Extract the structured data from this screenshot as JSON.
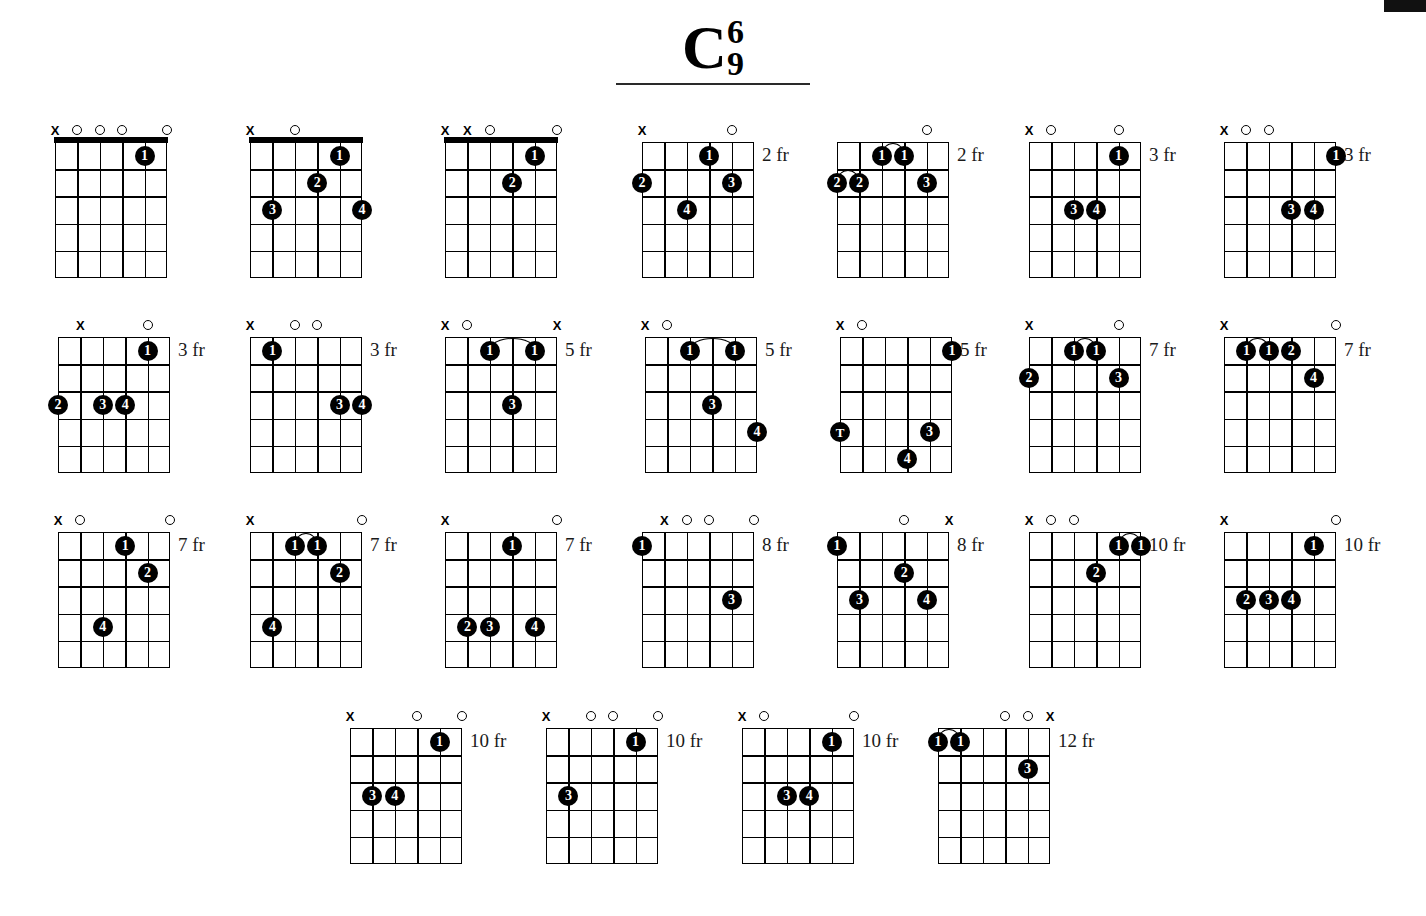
{
  "title": {
    "root": "C",
    "upper": "6",
    "lower": "9"
  },
  "meta": {
    "instrument": "guitar",
    "strings": 6,
    "frets": 5,
    "marker_open": "O",
    "marker_muted": "X"
  },
  "chords": [
    {
      "id": "chord-1",
      "x": 55,
      "y": 124,
      "fret_label": "",
      "nut": true,
      "markers": [
        "x",
        "o",
        "o",
        "o",
        "",
        "o"
      ],
      "dots": [
        {
          "string": 5,
          "fret": 1,
          "finger": "1"
        }
      ],
      "barres": []
    },
    {
      "id": "chord-2",
      "x": 250,
      "y": 124,
      "fret_label": "",
      "nut": true,
      "markers": [
        "x",
        "",
        "o",
        "",
        "",
        ""
      ],
      "dots": [
        {
          "string": 5,
          "fret": 1,
          "finger": "1"
        },
        {
          "string": 4,
          "fret": 2,
          "finger": "2"
        },
        {
          "string": 2,
          "fret": 3,
          "finger": "3"
        },
        {
          "string": 6,
          "fret": 3,
          "finger": "4"
        }
      ],
      "barres": []
    },
    {
      "id": "chord-3",
      "x": 445,
      "y": 124,
      "fret_label": "",
      "nut": true,
      "markers": [
        "x",
        "x",
        "o",
        "",
        "",
        "o"
      ],
      "dots": [
        {
          "string": 5,
          "fret": 1,
          "finger": "1"
        },
        {
          "string": 4,
          "fret": 2,
          "finger": "2"
        }
      ],
      "barres": []
    },
    {
      "id": "chord-4",
      "x": 642,
      "y": 124,
      "fret_label": "2 fr",
      "nut": false,
      "markers": [
        "x",
        "",
        "",
        "",
        "o",
        ""
      ],
      "dots": [
        {
          "string": 4,
          "fret": 1,
          "finger": "1"
        },
        {
          "string": 1,
          "fret": 2,
          "finger": "2"
        },
        {
          "string": 5,
          "fret": 2,
          "finger": "3"
        },
        {
          "string": 3,
          "fret": 3,
          "finger": "4"
        }
      ],
      "barres": []
    },
    {
      "id": "chord-5",
      "x": 837,
      "y": 124,
      "fret_label": "2 fr",
      "nut": false,
      "markers": [
        "",
        "",
        "",
        "",
        "o",
        ""
      ],
      "dots": [
        {
          "string": 3,
          "fret": 1,
          "finger": "1"
        },
        {
          "string": 4,
          "fret": 1,
          "finger": "1"
        },
        {
          "string": 1,
          "fret": 2,
          "finger": "2"
        },
        {
          "string": 2,
          "fret": 2,
          "finger": "2"
        },
        {
          "string": 5,
          "fret": 2,
          "finger": "3"
        }
      ],
      "barres": [
        {
          "fret": 1,
          "from": 3,
          "to": 4
        },
        {
          "fret": 2,
          "from": 1,
          "to": 2
        }
      ]
    },
    {
      "id": "chord-6",
      "x": 1029,
      "y": 124,
      "fret_label": "3 fr",
      "nut": false,
      "markers": [
        "x",
        "o",
        "",
        "",
        "o",
        ""
      ],
      "dots": [
        {
          "string": 5,
          "fret": 1,
          "finger": "1"
        },
        {
          "string": 3,
          "fret": 3,
          "finger": "3"
        },
        {
          "string": 4,
          "fret": 3,
          "finger": "4"
        }
      ],
      "barres": []
    },
    {
      "id": "chord-7",
      "x": 1224,
      "y": 124,
      "fret_label": "3 fr",
      "nut": false,
      "markers": [
        "x",
        "o",
        "o",
        "",
        "",
        ""
      ],
      "dots": [
        {
          "string": 6,
          "fret": 1,
          "finger": "1"
        },
        {
          "string": 4,
          "fret": 3,
          "finger": "3"
        },
        {
          "string": 5,
          "fret": 3,
          "finger": "4"
        }
      ],
      "barres": []
    },
    {
      "id": "chord-8",
      "x": 58,
      "y": 319,
      "fret_label": "3 fr",
      "nut": false,
      "markers": [
        "",
        "x",
        "",
        "",
        "o",
        ""
      ],
      "dots": [
        {
          "string": 5,
          "fret": 1,
          "finger": "1"
        },
        {
          "string": 1,
          "fret": 3,
          "finger": "2"
        },
        {
          "string": 3,
          "fret": 3,
          "finger": "3"
        },
        {
          "string": 4,
          "fret": 3,
          "finger": "4"
        }
      ],
      "barres": []
    },
    {
      "id": "chord-9",
      "x": 250,
      "y": 319,
      "fret_label": "3 fr",
      "nut": false,
      "markers": [
        "x",
        "",
        "o",
        "o",
        "",
        ""
      ],
      "dots": [
        {
          "string": 2,
          "fret": 1,
          "finger": "1"
        },
        {
          "string": 5,
          "fret": 3,
          "finger": "3"
        },
        {
          "string": 6,
          "fret": 3,
          "finger": "4"
        }
      ],
      "barres": []
    },
    {
      "id": "chord-10",
      "x": 445,
      "y": 319,
      "fret_label": "5 fr",
      "nut": false,
      "markers": [
        "x",
        "o",
        "",
        "",
        "",
        "x"
      ],
      "dots": [
        {
          "string": 3,
          "fret": 1,
          "finger": "1"
        },
        {
          "string": 5,
          "fret": 1,
          "finger": "1"
        },
        {
          "string": 4,
          "fret": 3,
          "finger": "3"
        }
      ],
      "barres": [
        {
          "fret": 1,
          "from": 3,
          "to": 5
        }
      ]
    },
    {
      "id": "chord-11",
      "x": 645,
      "y": 319,
      "fret_label": "5 fr",
      "nut": false,
      "markers": [
        "x",
        "o",
        "",
        "",
        "",
        ""
      ],
      "dots": [
        {
          "string": 3,
          "fret": 1,
          "finger": "1"
        },
        {
          "string": 5,
          "fret": 1,
          "finger": "1"
        },
        {
          "string": 4,
          "fret": 3,
          "finger": "3"
        },
        {
          "string": 6,
          "fret": 4,
          "finger": "4"
        }
      ],
      "barres": [
        {
          "fret": 1,
          "from": 3,
          "to": 5
        }
      ]
    },
    {
      "id": "chord-12",
      "x": 840,
      "y": 319,
      "fret_label": "5 fr",
      "nut": false,
      "markers": [
        "x",
        "o",
        "",
        "",
        "",
        ""
      ],
      "dots": [
        {
          "string": 6,
          "fret": 1,
          "finger": "1"
        },
        {
          "string": 1,
          "fret": 4,
          "finger": "T"
        },
        {
          "string": 5,
          "fret": 4,
          "finger": "3"
        },
        {
          "string": 4,
          "fret": 5,
          "finger": "4"
        }
      ],
      "barres": []
    },
    {
      "id": "chord-13",
      "x": 1029,
      "y": 319,
      "fret_label": "7 fr",
      "nut": false,
      "markers": [
        "x",
        "",
        "",
        "",
        "o",
        ""
      ],
      "dots": [
        {
          "string": 3,
          "fret": 1,
          "finger": "1"
        },
        {
          "string": 4,
          "fret": 1,
          "finger": "1"
        },
        {
          "string": 1,
          "fret": 2,
          "finger": "2"
        },
        {
          "string": 5,
          "fret": 2,
          "finger": "3"
        }
      ],
      "barres": [
        {
          "fret": 1,
          "from": 3,
          "to": 4
        }
      ]
    },
    {
      "id": "chord-14",
      "x": 1224,
      "y": 319,
      "fret_label": "7 fr",
      "nut": false,
      "markers": [
        "x",
        "",
        "",
        "",
        "",
        "o"
      ],
      "dots": [
        {
          "string": 2,
          "fret": 1,
          "finger": "1"
        },
        {
          "string": 3,
          "fret": 1,
          "finger": "1"
        },
        {
          "string": 4,
          "fret": 1,
          "finger": "2"
        },
        {
          "string": 5,
          "fret": 2,
          "finger": "4"
        }
      ],
      "barres": [
        {
          "fret": 1,
          "from": 2,
          "to": 3
        }
      ]
    },
    {
      "id": "chord-15",
      "x": 58,
      "y": 514,
      "fret_label": "7 fr",
      "nut": false,
      "markers": [
        "x",
        "o",
        "",
        "",
        "",
        "o"
      ],
      "dots": [
        {
          "string": 4,
          "fret": 1,
          "finger": "1"
        },
        {
          "string": 5,
          "fret": 2,
          "finger": "2"
        },
        {
          "string": 3,
          "fret": 4,
          "finger": "4"
        }
      ],
      "barres": []
    },
    {
      "id": "chord-16",
      "x": 250,
      "y": 514,
      "fret_label": "7 fr",
      "nut": false,
      "markers": [
        "x",
        "",
        "",
        "",
        "",
        "o"
      ],
      "dots": [
        {
          "string": 3,
          "fret": 1,
          "finger": "1"
        },
        {
          "string": 4,
          "fret": 1,
          "finger": "1"
        },
        {
          "string": 5,
          "fret": 2,
          "finger": "2"
        },
        {
          "string": 2,
          "fret": 4,
          "finger": "4"
        }
      ],
      "barres": [
        {
          "fret": 1,
          "from": 3,
          "to": 4
        }
      ]
    },
    {
      "id": "chord-17",
      "x": 445,
      "y": 514,
      "fret_label": "7 fr",
      "nut": false,
      "markers": [
        "x",
        "",
        "",
        "",
        "",
        "o"
      ],
      "dots": [
        {
          "string": 4,
          "fret": 1,
          "finger": "1"
        },
        {
          "string": 2,
          "fret": 4,
          "finger": "2"
        },
        {
          "string": 3,
          "fret": 4,
          "finger": "3"
        },
        {
          "string": 5,
          "fret": 4,
          "finger": "4"
        }
      ],
      "barres": []
    },
    {
      "id": "chord-18",
      "x": 642,
      "y": 514,
      "fret_label": "8 fr",
      "nut": false,
      "markers": [
        "",
        "x",
        "o",
        "o",
        "",
        "o"
      ],
      "dots": [
        {
          "string": 1,
          "fret": 1,
          "finger": "1"
        },
        {
          "string": 5,
          "fret": 3,
          "finger": "3"
        }
      ],
      "barres": []
    },
    {
      "id": "chord-19",
      "x": 837,
      "y": 514,
      "fret_label": "8 fr",
      "nut": false,
      "markers": [
        "",
        "",
        "",
        "o",
        "",
        "x"
      ],
      "dots": [
        {
          "string": 1,
          "fret": 1,
          "finger": "1"
        },
        {
          "string": 4,
          "fret": 2,
          "finger": "2"
        },
        {
          "string": 2,
          "fret": 3,
          "finger": "3"
        },
        {
          "string": 5,
          "fret": 3,
          "finger": "4"
        }
      ],
      "barres": []
    },
    {
      "id": "chord-20",
      "x": 1029,
      "y": 514,
      "fret_label": "10 fr",
      "nut": false,
      "markers": [
        "x",
        "o",
        "o",
        "",
        "",
        ""
      ],
      "dots": [
        {
          "string": 5,
          "fret": 1,
          "finger": "1"
        },
        {
          "string": 6,
          "fret": 1,
          "finger": "1"
        },
        {
          "string": 4,
          "fret": 2,
          "finger": "2"
        }
      ],
      "barres": [
        {
          "fret": 1,
          "from": 5,
          "to": 6
        }
      ]
    },
    {
      "id": "chord-21",
      "x": 1224,
      "y": 514,
      "fret_label": "10 fr",
      "nut": false,
      "markers": [
        "x",
        "",
        "",
        "",
        "",
        "o"
      ],
      "dots": [
        {
          "string": 5,
          "fret": 1,
          "finger": "1"
        },
        {
          "string": 2,
          "fret": 3,
          "finger": "2"
        },
        {
          "string": 3,
          "fret": 3,
          "finger": "3"
        },
        {
          "string": 4,
          "fret": 3,
          "finger": "4"
        }
      ],
      "barres": []
    },
    {
      "id": "chord-22",
      "x": 350,
      "y": 710,
      "fret_label": "10 fr",
      "nut": false,
      "markers": [
        "x",
        "",
        "",
        "o",
        "",
        "o"
      ],
      "dots": [
        {
          "string": 5,
          "fret": 1,
          "finger": "1"
        },
        {
          "string": 2,
          "fret": 3,
          "finger": "3"
        },
        {
          "string": 3,
          "fret": 3,
          "finger": "4"
        }
      ],
      "barres": []
    },
    {
      "id": "chord-23",
      "x": 546,
      "y": 710,
      "fret_label": "10 fr",
      "nut": false,
      "markers": [
        "x",
        "",
        "o",
        "o",
        "",
        "o"
      ],
      "dots": [
        {
          "string": 5,
          "fret": 1,
          "finger": "1"
        },
        {
          "string": 2,
          "fret": 3,
          "finger": "3"
        }
      ],
      "barres": []
    },
    {
      "id": "chord-24",
      "x": 742,
      "y": 710,
      "fret_label": "10 fr",
      "nut": false,
      "markers": [
        "x",
        "o",
        "",
        "",
        "",
        "o"
      ],
      "dots": [
        {
          "string": 5,
          "fret": 1,
          "finger": "1"
        },
        {
          "string": 3,
          "fret": 3,
          "finger": "3"
        },
        {
          "string": 4,
          "fret": 3,
          "finger": "4"
        }
      ],
      "barres": []
    },
    {
      "id": "chord-25",
      "x": 938,
      "y": 710,
      "fret_label": "12 fr",
      "nut": false,
      "markers": [
        "",
        "",
        "",
        "o",
        "o",
        "x"
      ],
      "dots": [
        {
          "string": 1,
          "fret": 1,
          "finger": "1"
        },
        {
          "string": 2,
          "fret": 1,
          "finger": "1"
        },
        {
          "string": 5,
          "fret": 2,
          "finger": "3"
        }
      ],
      "barres": [
        {
          "fret": 1,
          "from": 1,
          "to": 2
        }
      ]
    }
  ]
}
